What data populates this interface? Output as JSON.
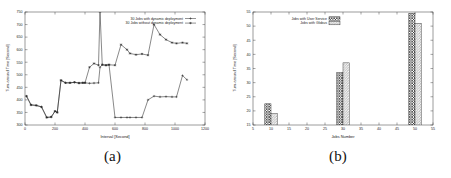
{
  "figure": {
    "subfigures": [
      {
        "caption": "(a)"
      },
      {
        "caption": "(b)"
      }
    ]
  },
  "chart_data": [
    {
      "type": "line",
      "title": "",
      "xlabel": "Interval [Second]",
      "ylabel": "Turn-around Time [Second]",
      "xlim": [
        0,
        1200
      ],
      "ylim": [
        300,
        750
      ],
      "xticks": [
        0,
        200,
        400,
        600,
        800,
        1000,
        1200
      ],
      "yticks": [
        300,
        350,
        400,
        450,
        500,
        550,
        600,
        650,
        700,
        750
      ],
      "grid": false,
      "legend_position": "top-right",
      "series": [
        {
          "name": "30 Jobs with dynamic deployment",
          "marker": "plus",
          "x": [
            10,
            40,
            75,
            110,
            145,
            175,
            200,
            215,
            240,
            270,
            300,
            330,
            360,
            385,
            400,
            430,
            460,
            490,
            500,
            515,
            540,
            560,
            600,
            640,
            680,
            700,
            740,
            780,
            820,
            860,
            900,
            940,
            980,
            1010,
            1050,
            1080
          ],
          "y": [
            415,
            380,
            378,
            372,
            330,
            332,
            355,
            350,
            478,
            468,
            468,
            470,
            467,
            468,
            468,
            466,
            467,
            468,
            530,
            540,
            538,
            540,
            330,
            330,
            330,
            330,
            330,
            330,
            400,
            415,
            412,
            413,
            412,
            412,
            497,
            480
          ]
        },
        {
          "name": "30 Jobs without dynamic deployment",
          "marker": "star",
          "x": [
            10,
            40,
            75,
            110,
            145,
            175,
            200,
            215,
            240,
            270,
            300,
            330,
            360,
            385,
            400,
            430,
            460,
            490,
            500,
            515,
            540,
            560,
            600,
            640,
            680,
            700,
            740,
            780,
            820,
            860,
            900,
            940,
            980,
            1010,
            1050,
            1080
          ],
          "y": [
            415,
            380,
            378,
            372,
            330,
            332,
            355,
            350,
            478,
            468,
            468,
            470,
            467,
            468,
            468,
            530,
            545,
            538,
            752,
            540,
            538,
            540,
            538,
            620,
            600,
            585,
            580,
            583,
            578,
            700,
            660,
            640,
            628,
            625,
            628,
            625
          ]
        }
      ]
    },
    {
      "type": "bar",
      "title": "",
      "xlabel": "Jobs Number",
      "ylabel": "Turn-around Time [Second]",
      "xlim": [
        5,
        55
      ],
      "ylim": [
        15,
        55
      ],
      "xticks": [
        5,
        10,
        15,
        20,
        25,
        30,
        35,
        40,
        45,
        50,
        55
      ],
      "yticks": [
        15,
        20,
        25,
        30,
        35,
        40,
        45,
        50,
        55
      ],
      "grid": false,
      "legend_position": "top-left",
      "categories": [
        10,
        30,
        50
      ],
      "series": [
        {
          "name": "Jobs with User Service",
          "pattern": "crosshatch",
          "values": [
            22.5,
            33.5,
            54.5
          ]
        },
        {
          "name": "Jobs with Globus",
          "pattern": "diagonal",
          "values": [
            19.0,
            37.0,
            51.0
          ]
        }
      ]
    }
  ]
}
